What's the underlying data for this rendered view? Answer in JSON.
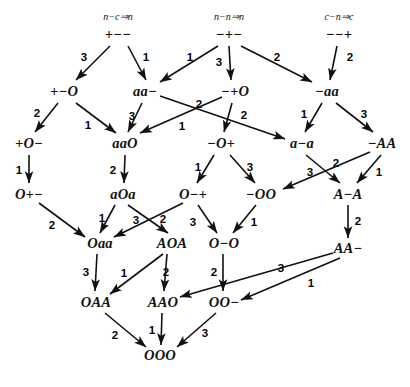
{
  "figure": {
    "background": "#ffffff",
    "ink": "#111111"
  },
  "rules": [
    {
      "id": "rule-left",
      "text": "n−c⇒n",
      "x": 118,
      "y": 16
    },
    {
      "id": "rule-middle",
      "text": "n−n⇒n",
      "x": 229,
      "y": 16
    },
    {
      "id": "rule-right",
      "text": "c−n⇒c",
      "x": 339,
      "y": 16
    }
  ],
  "nodes": [
    {
      "id": "n-pmm",
      "label": "+−−",
      "x": 118,
      "y": 34
    },
    {
      "id": "n-mpm",
      "label": "−+−",
      "x": 229,
      "y": 34
    },
    {
      "id": "n-mmp",
      "label": "−−+",
      "x": 339,
      "y": 34
    },
    {
      "id": "n-pmO",
      "label": "+−O",
      "x": 64,
      "y": 91
    },
    {
      "id": "n-aam",
      "label": "aa−",
      "x": 145,
      "y": 91
    },
    {
      "id": "n-mpO",
      "label": "−+O",
      "x": 235,
      "y": 91
    },
    {
      "id": "n-maa",
      "label": "−aa",
      "x": 327,
      "y": 91
    },
    {
      "id": "n-pOm",
      "label": "+O−",
      "x": 29,
      "y": 143
    },
    {
      "id": "n-aaO",
      "label": "aaO",
      "x": 125,
      "y": 143
    },
    {
      "id": "n-mOp",
      "label": "−O+",
      "x": 221,
      "y": 143
    },
    {
      "id": "n-ama",
      "label": "a−a",
      "x": 302,
      "y": 143
    },
    {
      "id": "n-mAA",
      "label": "−AA",
      "x": 382,
      "y": 143
    },
    {
      "id": "n-Opm",
      "label": "O+−",
      "x": 29,
      "y": 194
    },
    {
      "id": "n-aOa",
      "label": "aOa",
      "x": 123,
      "y": 194
    },
    {
      "id": "n-Omp",
      "label": "O−+",
      "x": 193,
      "y": 194
    },
    {
      "id": "n-mOO",
      "label": "−OO",
      "x": 261,
      "y": 194
    },
    {
      "id": "n-AmA",
      "label": "A−A",
      "x": 348,
      "y": 194
    },
    {
      "id": "n-Oaa",
      "label": "Oaa",
      "x": 100,
      "y": 243
    },
    {
      "id": "n-AOA",
      "label": "AOA",
      "x": 172,
      "y": 243
    },
    {
      "id": "n-OmO",
      "label": "O−O",
      "x": 224,
      "y": 243
    },
    {
      "id": "n-AAm",
      "label": "AA−",
      "x": 348,
      "y": 248
    },
    {
      "id": "n-OAA",
      "label": "OAA",
      "x": 96,
      "y": 302
    },
    {
      "id": "n-AAO",
      "label": "AAO",
      "x": 163,
      "y": 302
    },
    {
      "id": "n-OOm",
      "label": "OO−",
      "x": 224,
      "y": 302
    },
    {
      "id": "n-OOO",
      "label": "OOO",
      "x": 160,
      "y": 355
    }
  ],
  "edges": [
    {
      "from": "+−−",
      "to": "+−O",
      "label": "3",
      "x1": 110,
      "y1": 46,
      "x2": 76,
      "y2": 80,
      "lx": 84,
      "ly": 57
    },
    {
      "from": "+−−",
      "to": "aa−",
      "label": "1",
      "x1": 128,
      "y1": 46,
      "x2": 146,
      "y2": 80,
      "lx": 146,
      "ly": 57
    },
    {
      "from": "−+−",
      "to": "aa−",
      "label": "1",
      "x1": 218,
      "y1": 46,
      "x2": 160,
      "y2": 82,
      "lx": 190,
      "ly": 57
    },
    {
      "from": "−+−",
      "to": "−+O",
      "label": "3",
      "x1": 229,
      "y1": 46,
      "x2": 231,
      "y2": 80,
      "lx": 219,
      "ly": 62
    },
    {
      "from": "−+−",
      "to": "−aa",
      "label": "2",
      "x1": 241,
      "y1": 46,
      "x2": 312,
      "y2": 82,
      "lx": 277,
      "ly": 57
    },
    {
      "from": "−−+",
      "to": "−aa",
      "label": "2",
      "x1": 337,
      "y1": 46,
      "x2": 330,
      "y2": 80,
      "lx": 350,
      "ly": 57
    },
    {
      "from": "+−O",
      "to": "+O−",
      "label": "2",
      "x1": 58,
      "y1": 103,
      "x2": 35,
      "y2": 132,
      "lx": 37,
      "ly": 113
    },
    {
      "from": "+−O",
      "to": "aaO",
      "label": "1",
      "x1": 76,
      "y1": 103,
      "x2": 116,
      "y2": 133,
      "lx": 88,
      "ly": 125
    },
    {
      "from": "aa−",
      "to": "aaO",
      "label": "3",
      "x1": 142,
      "y1": 103,
      "x2": 128,
      "y2": 132,
      "lx": 132,
      "ly": 116
    },
    {
      "from": "aa−",
      "to": "a−a",
      "label": "2",
      "x1": 160,
      "y1": 96,
      "x2": 285,
      "y2": 139,
      "lx": 199,
      "ly": 104
    },
    {
      "from": "−+O",
      "to": "aaO",
      "label": "1",
      "x1": 222,
      "y1": 97,
      "x2": 140,
      "y2": 133,
      "lx": 182,
      "ly": 126
    },
    {
      "from": "−+O",
      "to": "−O+",
      "label": "2",
      "x1": 232,
      "y1": 103,
      "x2": 224,
      "y2": 132,
      "lx": 244,
      "ly": 115
    },
    {
      "from": "−aa",
      "to": "a−a",
      "label": "1",
      "x1": 322,
      "y1": 103,
      "x2": 305,
      "y2": 132,
      "lx": 304,
      "ly": 114
    },
    {
      "from": "−aa",
      "to": "−AA",
      "label": "3",
      "x1": 336,
      "y1": 103,
      "x2": 373,
      "y2": 132,
      "lx": 364,
      "ly": 114
    },
    {
      "from": "+O−",
      "to": "O+−",
      "label": "1",
      "x1": 29,
      "y1": 155,
      "x2": 29,
      "y2": 183,
      "lx": 19,
      "ly": 170
    },
    {
      "from": "aaO",
      "to": "aOa",
      "label": "2",
      "x1": 125,
      "y1": 155,
      "x2": 124,
      "y2": 183,
      "lx": 113,
      "ly": 170
    },
    {
      "from": "−O+",
      "to": "O−+",
      "label": "1",
      "x1": 214,
      "y1": 155,
      "x2": 197,
      "y2": 183,
      "lx": 198,
      "ly": 167
    },
    {
      "from": "−O+",
      "to": "−OO",
      "label": "3",
      "x1": 230,
      "y1": 155,
      "x2": 255,
      "y2": 183,
      "lx": 250,
      "ly": 167
    },
    {
      "from": "a−a",
      "to": "A−A",
      "label": "3",
      "x1": 306,
      "y1": 155,
      "x2": 340,
      "y2": 183,
      "lx": 310,
      "ly": 172
    },
    {
      "from": "−AA",
      "to": "−OO",
      "label": "2",
      "x1": 370,
      "y1": 152,
      "x2": 283,
      "y2": 189,
      "lx": 336,
      "ly": 163
    },
    {
      "from": "−AA",
      "to": "A−A",
      "label": "1",
      "x1": 381,
      "y1": 155,
      "x2": 357,
      "y2": 183,
      "lx": 379,
      "ly": 172
    },
    {
      "from": "O+−",
      "to": "Oaa",
      "label": "2",
      "x1": 39,
      "y1": 203,
      "x2": 85,
      "y2": 237,
      "lx": 52,
      "ly": 225
    },
    {
      "from": "aOa",
      "to": "Oaa",
      "label": "1",
      "x1": 115,
      "y1": 205,
      "x2": 100,
      "y2": 233,
      "lx": 102,
      "ly": 218
    },
    {
      "from": "aOa",
      "to": "AOA",
      "label": "3",
      "x1": 128,
      "y1": 205,
      "x2": 168,
      "y2": 233,
      "lx": 136,
      "ly": 220
    },
    {
      "from": "O−+",
      "to": "Oaa",
      "label": "2",
      "x1": 183,
      "y1": 203,
      "x2": 114,
      "y2": 237,
      "lx": 163,
      "ly": 219
    },
    {
      "from": "O−+",
      "to": "O−O",
      "label": "3",
      "x1": 198,
      "y1": 205,
      "x2": 217,
      "y2": 233,
      "lx": 193,
      "ly": 222
    },
    {
      "from": "−OO",
      "to": "O−O",
      "label": "1",
      "x1": 256,
      "y1": 205,
      "x2": 233,
      "y2": 233,
      "lx": 254,
      "ly": 222
    },
    {
      "from": "A−A",
      "to": "AA−",
      "label": "2",
      "x1": 348,
      "y1": 205,
      "x2": 348,
      "y2": 238,
      "lx": 358,
      "ly": 221
    },
    {
      "from": "Oaa",
      "to": "OAA",
      "label": "3",
      "x1": 97,
      "y1": 254,
      "x2": 95,
      "y2": 291,
      "lx": 86,
      "ly": 272
    },
    {
      "from": "AOA",
      "to": "OAA",
      "label": "1",
      "x1": 163,
      "y1": 254,
      "x2": 110,
      "y2": 294,
      "lx": 124,
      "ly": 273
    },
    {
      "from": "AOA",
      "to": "AAO",
      "label": "2",
      "x1": 167,
      "y1": 254,
      "x2": 164,
      "y2": 291,
      "lx": 166,
      "ly": 272
    },
    {
      "from": "O−O",
      "to": "OO−",
      "label": "2",
      "x1": 223,
      "y1": 254,
      "x2": 223,
      "y2": 291,
      "lx": 214,
      "ly": 272
    },
    {
      "from": "AA−",
      "to": "AAO",
      "label": "3",
      "x1": 333,
      "y1": 253,
      "x2": 180,
      "y2": 297,
      "lx": 281,
      "ly": 268
    },
    {
      "from": "AA−",
      "to": "OO−",
      "label": "1",
      "x1": 340,
      "y1": 258,
      "x2": 241,
      "y2": 300,
      "lx": 311,
      "ly": 283
    },
    {
      "from": "OAA",
      "to": "OOO",
      "label": "2",
      "x1": 105,
      "y1": 313,
      "x2": 146,
      "y2": 347,
      "lx": 115,
      "ly": 335
    },
    {
      "from": "AAO",
      "to": "OOO",
      "label": "1",
      "x1": 162,
      "y1": 313,
      "x2": 161,
      "y2": 345,
      "lx": 152,
      "ly": 330
    },
    {
      "from": "OO−",
      "to": "OOO",
      "label": "3",
      "x1": 216,
      "y1": 313,
      "x2": 177,
      "y2": 347,
      "lx": 205,
      "ly": 333
    }
  ]
}
